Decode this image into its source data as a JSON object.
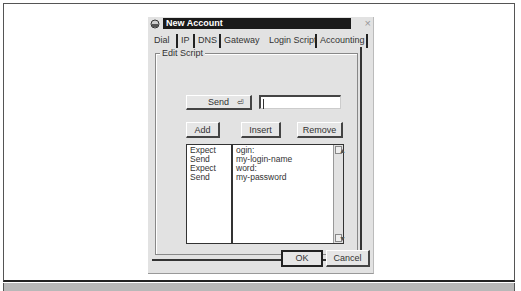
{
  "dialog": {
    "title": "New Account",
    "close_icon": "×",
    "tabs": [
      {
        "label": "Dial"
      },
      {
        "label": "IP"
      },
      {
        "label": "DNS"
      },
      {
        "label": "Gateway"
      },
      {
        "label": "Login Script",
        "active": true
      },
      {
        "label": "Accounting"
      }
    ],
    "group_label": "Edit Script",
    "send_dropdown": {
      "label": "Send",
      "glyph": "⏎"
    },
    "script_input": {
      "value": ""
    },
    "buttons": {
      "add": "Add",
      "insert": "Insert",
      "remove": "Remove",
      "ok": "OK",
      "cancel": "Cancel"
    },
    "script": {
      "actions": [
        "Expect",
        "Send",
        "Expect",
        "Send"
      ],
      "values": [
        "ogin:",
        "my-login-name",
        "word:",
        "my-password"
      ]
    }
  }
}
